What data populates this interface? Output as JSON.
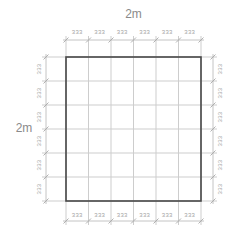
{
  "diagram": {
    "overall_width_label": "2m",
    "overall_height_label": "2m",
    "segments": 6,
    "dimensions": {
      "top": [
        "333",
        "333",
        "333",
        "333",
        "333",
        "333"
      ],
      "bottom": [
        "333",
        "333",
        "333",
        "333",
        "333",
        "333"
      ],
      "left": [
        "333",
        "333",
        "333",
        "333",
        "333",
        "333"
      ],
      "right": [
        "333",
        "333",
        "333",
        "333",
        "333",
        "333"
      ]
    },
    "colors": {
      "background": "#ffffff",
      "outline": "#474747",
      "grid_line": "#cdcdcd",
      "dim_line": "#c4c4c4",
      "tick": "#a8a8a8",
      "dim_text": "#a3a3a3",
      "overall_text": "#8a8a8a"
    }
  }
}
